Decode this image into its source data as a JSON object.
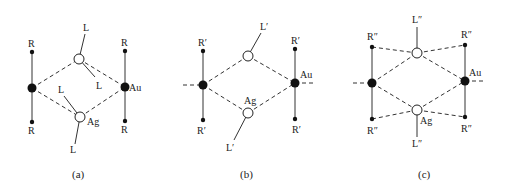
{
  "figure": {
    "panels": [
      {
        "caption": "(a)",
        "au_label": "Au",
        "ag_label": "Ag",
        "r_labels": [
          "R",
          "R",
          "R",
          "R"
        ],
        "l_labels": [
          "L",
          "L",
          "L",
          "L"
        ]
      },
      {
        "caption": "(b)",
        "au_label": "Au",
        "ag_label": "Ag",
        "r_labels": [
          "R′",
          "R′",
          "R′",
          "R′"
        ],
        "l_labels": [
          "L′",
          "L′"
        ]
      },
      {
        "caption": "(c)",
        "au_label": "Au",
        "ag_label": "Ag",
        "r_labels": [
          "R″",
          "R″",
          "R″",
          "R″"
        ],
        "l_labels": [
          "L″",
          "L″"
        ]
      }
    ],
    "legend": {
      "filled_circle": "Au",
      "open_circle": "Ag"
    }
  }
}
